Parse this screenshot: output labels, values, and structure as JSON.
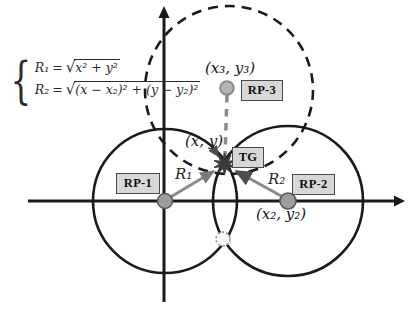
{
  "figure": {
    "formula": {
      "brace": "{",
      "line1": {
        "lhs": "R₁",
        "eq": "=",
        "radical": "√",
        "radicand": "x² + y²"
      },
      "line2": {
        "lhs": "R₂",
        "eq": "=",
        "radical": "√",
        "radicand": "(x − x₂)² + (y − y₂)²"
      }
    },
    "labels": {
      "rp3_coord": "(x₃, y₃)",
      "tg_coord": "(x, y)",
      "rp2_coord": "(x₂, y₂)",
      "r1": "R₁",
      "r2": "R₂"
    },
    "tags": {
      "rp1": "RP-1",
      "rp2": "RP-2",
      "rp3": "RP-3",
      "tg": "TG"
    },
    "colors": {
      "line": "#1a1a1a",
      "gray": "#8a8a8a",
      "tag_fill": "#d8d8d8",
      "tag_border": "#4a4a4a",
      "star": "#3a3a3a"
    }
  }
}
